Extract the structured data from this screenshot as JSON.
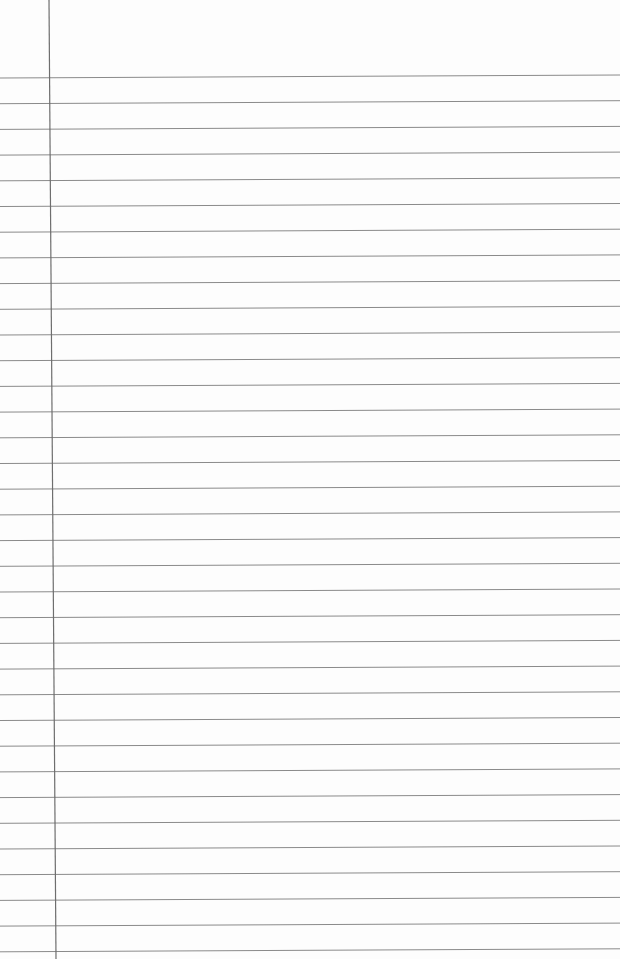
{
  "paper": {
    "type": "ruled notebook paper",
    "background_color": "#fdfdfd",
    "line_color": "#8a8a8a",
    "margin_line_color": "#6e6e6e",
    "first_line_y_left": 78,
    "first_line_y_right": 75,
    "line_spacing": 25.7,
    "line_count": 35,
    "margin_x_top": 49,
    "margin_x_bottom": 56
  }
}
